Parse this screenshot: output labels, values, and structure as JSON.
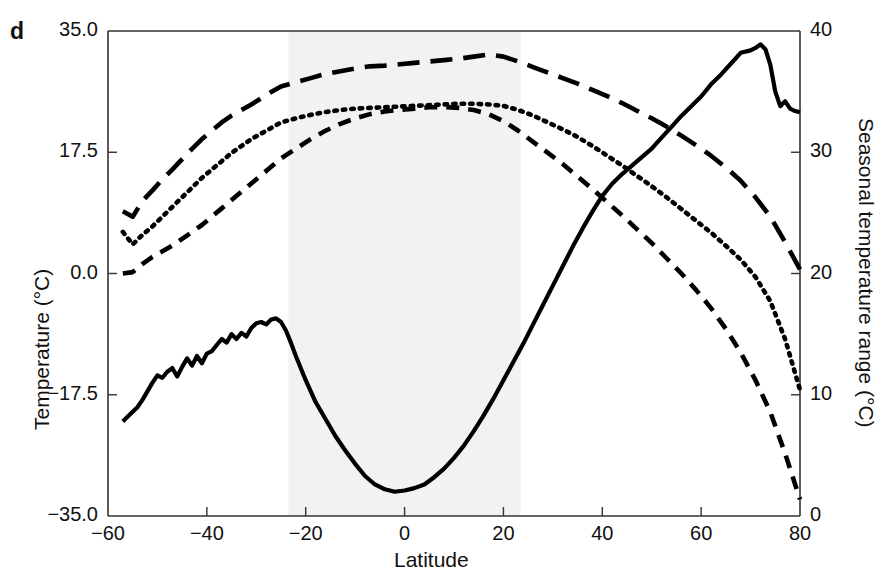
{
  "panel": {
    "label": "d"
  },
  "chart_data": {
    "type": "line",
    "title": "",
    "xlabel": "Latitude",
    "ylabel": "Temperature (°C)",
    "ylabel_right": "Seasonal temperature range (°C)",
    "xlim": [
      -60,
      80
    ],
    "ylim": [
      -35.0,
      35.0
    ],
    "ylim_right": [
      0,
      40
    ],
    "xticks": [
      -60,
      -40,
      -20,
      0,
      20,
      40,
      60,
      80
    ],
    "xtick_labels": [
      "−60",
      "−40",
      "−20",
      "0",
      "20",
      "40",
      "60",
      "80"
    ],
    "yticks": [
      -35.0,
      -17.5,
      0.0,
      17.5,
      35.0
    ],
    "ytick_labels": [
      "−35.0",
      "−17.5",
      "0.0",
      "17.5",
      "35.0"
    ],
    "yticks_right": [
      0,
      10,
      20,
      30,
      40
    ],
    "ytick_labels_right": [
      "0",
      "10",
      "20",
      "30",
      "40"
    ],
    "grid": false,
    "legend": "none",
    "annotations": [
      {
        "text": "Tropics",
        "x": -0.5,
        "y": 7.0,
        "kind": "shaded-band-label"
      }
    ],
    "shaded_regions": [
      {
        "name": "Tropics",
        "x_start": -23.5,
        "x_end": 23.5,
        "color": "#f2f2f2"
      }
    ],
    "series": [
      {
        "name": "Seasonal temperature range",
        "style": "solid",
        "axis": "right",
        "color": "#000000",
        "x": [
          -57,
          -56,
          -55,
          -54,
          -53,
          -52,
          -51,
          -50,
          -49,
          -48,
          -47,
          -46,
          -45,
          -44,
          -43,
          -42,
          -41,
          -40,
          -39,
          -38,
          -37,
          -36,
          -35,
          -34,
          -33,
          -32,
          -31,
          -30,
          -29,
          -28,
          -27,
          -26,
          -25,
          -24,
          -23,
          -22,
          -20,
          -18,
          -16,
          -14,
          -12,
          -10,
          -8,
          -6,
          -4,
          -2,
          0,
          2,
          4,
          6,
          8,
          10,
          12,
          14,
          16,
          18,
          20,
          22,
          24,
          26,
          28,
          30,
          32,
          34,
          36,
          38,
          40,
          42,
          44,
          46,
          48,
          50,
          52,
          54,
          56,
          58,
          60,
          62,
          64,
          66,
          68,
          70,
          71,
          72,
          73,
          74,
          75,
          76,
          77,
          78,
          79,
          80
        ],
        "y": [
          7.8,
          8.2,
          8.6,
          9.0,
          9.6,
          10.3,
          11.0,
          11.6,
          11.4,
          11.9,
          12.2,
          11.5,
          12.3,
          13.0,
          12.4,
          13.2,
          12.6,
          13.4,
          13.6,
          14.1,
          14.6,
          14.3,
          15.0,
          14.6,
          15.1,
          14.8,
          15.5,
          15.9,
          16.0,
          15.8,
          16.2,
          16.3,
          16.0,
          15.3,
          14.3,
          13.2,
          11.2,
          9.4,
          8.0,
          6.6,
          5.4,
          4.3,
          3.3,
          2.6,
          2.2,
          2.0,
          2.1,
          2.3,
          2.6,
          3.2,
          3.9,
          4.8,
          5.8,
          7.0,
          8.3,
          9.7,
          11.2,
          12.7,
          14.2,
          15.8,
          17.4,
          19.0,
          20.6,
          22.2,
          23.7,
          25.1,
          26.4,
          27.4,
          28.2,
          28.9,
          29.6,
          30.3,
          31.2,
          32.1,
          33.0,
          33.8,
          34.6,
          35.6,
          36.4,
          37.3,
          38.2,
          38.4,
          38.6,
          38.9,
          38.5,
          37.2,
          35.0,
          33.8,
          34.2,
          33.6,
          33.4,
          33.3
        ]
      },
      {
        "name": "Temperature (warm/upper curve)",
        "style": "long-dash",
        "axis": "left",
        "color": "#000000",
        "x": [
          -57,
          -55,
          -53,
          -51,
          -49,
          -47,
          -45,
          -43,
          -41,
          -39,
          -37,
          -35,
          -33,
          -31,
          -29,
          -27,
          -25,
          -22,
          -19,
          -16,
          -13,
          -10,
          -7,
          -4,
          -1,
          2,
          5,
          8,
          11,
          14,
          17,
          20,
          23,
          26,
          29,
          32,
          35,
          38,
          41,
          44,
          47,
          50,
          53,
          56,
          59,
          62,
          65,
          68,
          71,
          74,
          77,
          80
        ],
        "y": [
          9.0,
          8.2,
          10.5,
          12.0,
          13.6,
          15.0,
          16.5,
          18.0,
          19.4,
          20.6,
          21.8,
          22.8,
          23.6,
          24.4,
          25.3,
          26.2,
          27.0,
          27.6,
          28.2,
          28.8,
          29.2,
          29.6,
          29.9,
          30.0,
          30.2,
          30.4,
          30.6,
          30.8,
          31.0,
          31.3,
          31.6,
          31.3,
          30.6,
          29.8,
          29.0,
          28.2,
          27.4,
          26.5,
          25.6,
          24.6,
          23.5,
          22.4,
          21.2,
          19.9,
          18.5,
          17.0,
          15.3,
          13.4,
          11.0,
          8.2,
          4.5,
          0.6
        ]
      },
      {
        "name": "Temperature (mean/middle curve)",
        "style": "dotted",
        "axis": "left",
        "color": "#000000",
        "x": [
          -57,
          -55,
          -53,
          -51,
          -49,
          -47,
          -45,
          -43,
          -41,
          -39,
          -37,
          -35,
          -33,
          -31,
          -29,
          -27,
          -25,
          -22,
          -19,
          -16,
          -13,
          -10,
          -7,
          -4,
          -1,
          2,
          5,
          8,
          11,
          14,
          17,
          20,
          23,
          26,
          29,
          32,
          35,
          38,
          41,
          44,
          47,
          50,
          53,
          56,
          59,
          62,
          65,
          68,
          71,
          74,
          77,
          80
        ],
        "y": [
          6.0,
          4.2,
          5.6,
          6.8,
          8.2,
          9.6,
          11.0,
          12.4,
          13.8,
          15.0,
          16.2,
          17.4,
          18.4,
          19.4,
          20.2,
          21.0,
          21.8,
          22.4,
          22.9,
          23.3,
          23.6,
          23.8,
          23.9,
          24.0,
          24.1,
          24.2,
          24.3,
          24.4,
          24.5,
          24.5,
          24.4,
          24.2,
          23.6,
          22.8,
          21.8,
          20.8,
          19.7,
          18.4,
          17.0,
          15.6,
          14.1,
          12.6,
          11.0,
          9.3,
          7.6,
          5.9,
          4.0,
          2.0,
          -0.5,
          -4.0,
          -9.5,
          -16.8
        ]
      },
      {
        "name": "Temperature (cold/lower curve)",
        "style": "dash",
        "axis": "left",
        "color": "#000000",
        "x": [
          -57,
          -55,
          -53,
          -51,
          -49,
          -47,
          -45,
          -43,
          -41,
          -39,
          -37,
          -35,
          -33,
          -31,
          -29,
          -27,
          -25,
          -22,
          -19,
          -16,
          -13,
          -10,
          -7,
          -4,
          -1,
          2,
          5,
          8,
          11,
          14,
          17,
          20,
          23,
          26,
          29,
          32,
          35,
          38,
          41,
          44,
          47,
          50,
          53,
          56,
          59,
          62,
          65,
          68,
          71,
          74,
          77,
          80
        ],
        "y": [
          0.0,
          0.2,
          1.4,
          2.4,
          3.2,
          4.0,
          5.0,
          6.0,
          7.0,
          8.2,
          9.4,
          10.6,
          11.8,
          13.0,
          14.2,
          15.4,
          16.6,
          18.0,
          19.4,
          20.6,
          21.6,
          22.4,
          23.0,
          23.4,
          23.6,
          23.8,
          24.0,
          24.0,
          23.9,
          23.6,
          23.0,
          22.0,
          20.6,
          19.0,
          17.4,
          15.8,
          14.0,
          12.2,
          10.3,
          8.4,
          6.4,
          4.4,
          2.2,
          0.0,
          -2.4,
          -5.0,
          -8.0,
          -11.4,
          -15.4,
          -20.0,
          -26.0,
          -32.6
        ]
      }
    ]
  }
}
